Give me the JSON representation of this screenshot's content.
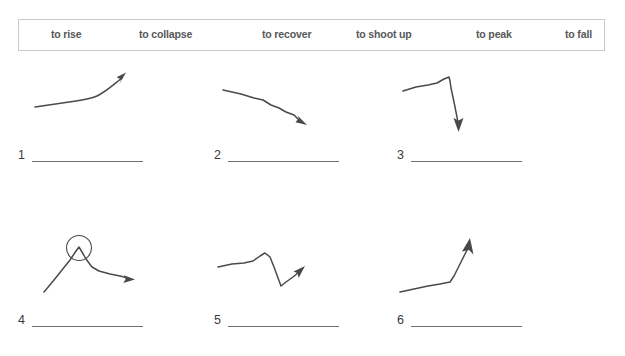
{
  "worksheet": {
    "wordbank": {
      "items": [
        {
          "label": "to rise",
          "x": 32
        },
        {
          "label": "to collapse",
          "x": 120
        },
        {
          "label": "to recover",
          "x": 243
        },
        {
          "label": "to shoot up",
          "x": 337
        },
        {
          "label": "to peak",
          "x": 457
        },
        {
          "label": "to fall",
          "x": 546
        }
      ],
      "border_color": "#c9c9c9",
      "text_color": "#58585a"
    },
    "items": [
      {
        "number": "1",
        "sketch_name": "rising-curve-sketch",
        "description": "line rising gradually then steeply upward with arrow at top right",
        "answer_value": ""
      },
      {
        "number": "2",
        "sketch_name": "falling-line-sketch",
        "description": "line sloping steadily downward with arrow at lower right",
        "answer_value": ""
      },
      {
        "number": "3",
        "sketch_name": "sharp-drop-sketch",
        "description": "line rising slightly then dropping vertically with arrow pointing down",
        "answer_value": ""
      },
      {
        "number": "4",
        "sketch_name": "peak-circled-sketch",
        "description": "line rising to a circled high point then falling and levelling off with arrow at right",
        "answer_value": ""
      },
      {
        "number": "5",
        "sketch_name": "dip-and-recover-sketch",
        "description": "line flat, dipping sharply down then rising again with arrow pointing up right",
        "answer_value": ""
      },
      {
        "number": "6",
        "sketch_name": "shoot-up-sketch",
        "description": "line flat then shooting steeply up with arrow at top",
        "answer_value": ""
      }
    ],
    "line_color": "#4a4a4c"
  }
}
